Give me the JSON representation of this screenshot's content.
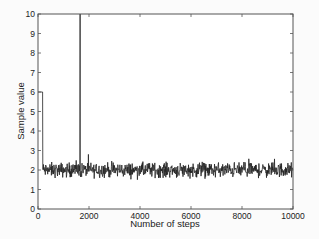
{
  "chart_data": {
    "type": "line",
    "title": "",
    "xlabel": "Number of steps",
    "ylabel": "Sample value",
    "xlim": [
      0,
      10000
    ],
    "ylim": [
      0,
      10
    ],
    "xticks": [
      0,
      2000,
      4000,
      6000,
      8000,
      10000
    ],
    "yticks": [
      0,
      1,
      2,
      3,
      4,
      5,
      6,
      7,
      8,
      9,
      10
    ],
    "grid": false,
    "legend": null,
    "series": [
      {
        "name": "Sample trace",
        "color": "#222222",
        "description": "MCMC trace: starts at 6, drops to ~2 near step 200, spikes to 10 at ~step 1650 then returns; fluctuates around 2 (range ~1.5-2.8) through step 10000",
        "key_points": [
          {
            "x": 0,
            "y": 6
          },
          {
            "x": 180,
            "y": 6
          },
          {
            "x": 190,
            "y": 2
          },
          {
            "x": 1640,
            "y": 2
          },
          {
            "x": 1650,
            "y": 10
          },
          {
            "x": 1660,
            "y": 2
          },
          {
            "x": 10000,
            "y": 2
          }
        ],
        "noise_mean": 2.0,
        "noise_range": [
          1.5,
          2.8
        ]
      }
    ]
  }
}
